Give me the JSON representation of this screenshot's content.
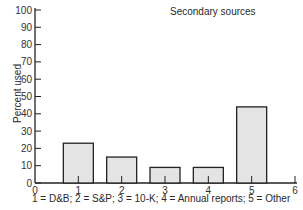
{
  "chart_data": {
    "type": "bar",
    "title": "Secondary sources",
    "xlabel": "1 = D&B; 2 = S&P; 3 = 10-K; 4 = Annual reports; 5 = Other",
    "ylabel": "Percent used",
    "categories": [
      "1",
      "2",
      "3",
      "4",
      "5"
    ],
    "category_names": [
      "D&B",
      "S&P",
      "10-K",
      "Annual reports",
      "Other"
    ],
    "x": [
      1,
      2,
      3,
      4,
      5
    ],
    "values": [
      23,
      15,
      9,
      9,
      44
    ],
    "xlim": [
      0,
      6
    ],
    "ylim": [
      0,
      100
    ],
    "xticks": [
      0,
      1,
      2,
      3,
      4,
      5,
      6
    ],
    "yticks": [
      0,
      10,
      20,
      30,
      40,
      50,
      60,
      70,
      80,
      90,
      100
    ],
    "grid": false,
    "legend": null,
    "bar_fill": "#e4e4e4",
    "bar_stroke": "#222222"
  }
}
